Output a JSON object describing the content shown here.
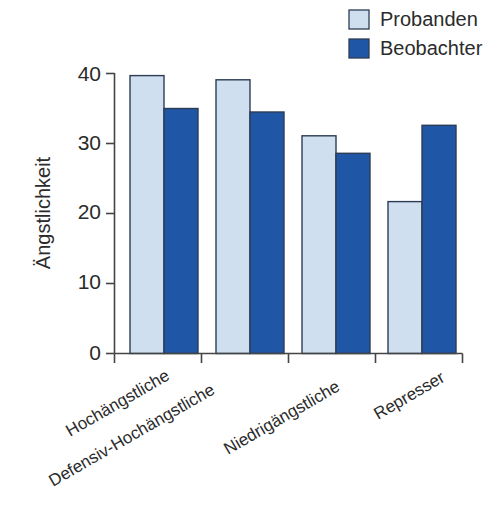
{
  "chart_data": {
    "type": "bar",
    "title": "",
    "subtitle": "",
    "xlabel": "",
    "ylabel": "Ängstlichkeit",
    "categories": [
      "Hochängstliche",
      "Defensiv-Hochängstliche",
      "Niedrigängstliche",
      "Represser"
    ],
    "series": [
      {
        "name": "Probanden",
        "color": "#cfdff0",
        "values": [
          39.7,
          39.1,
          31.1,
          21.7
        ]
      },
      {
        "name": "Beobachter",
        "color": "#1f56a5",
        "values": [
          35.0,
          34.5,
          28.6,
          32.6
        ]
      }
    ],
    "ylim": [
      0,
      40
    ],
    "yticks": [
      0,
      10,
      20,
      30,
      40
    ],
    "ytick_labels": [
      "0",
      "10",
      "20",
      "30",
      "40"
    ],
    "grid": false,
    "legend_position": "top-right",
    "category_label_rotation_deg": -30
  },
  "legend": {
    "entries": [
      {
        "label": "Probanden",
        "swatch_color": "#cfdff0"
      },
      {
        "label": "Beobachter",
        "swatch_color": "#1f56a5"
      }
    ]
  },
  "colors": {
    "probanden": "#cfdff0",
    "beobachter": "#1f56a5",
    "outline": "#2d3c54",
    "axis": "#444444",
    "text": "#2b2b2b",
    "background": "#ffffff"
  }
}
